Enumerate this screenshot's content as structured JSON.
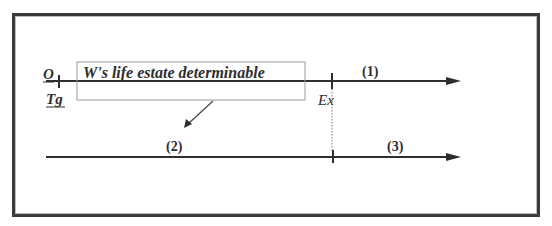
{
  "diagram": {
    "labels": {
      "owner": "O",
      "grantee": "Tg",
      "box_text": "W's life estate determinable",
      "event": "Ex",
      "segment_1": "(1)",
      "segment_2": "(2)",
      "segment_3": "(3)"
    },
    "colors": {
      "line": "#2e2e2e",
      "box_border": "#9a9a9a",
      "frame": "#3a3a3a"
    }
  }
}
